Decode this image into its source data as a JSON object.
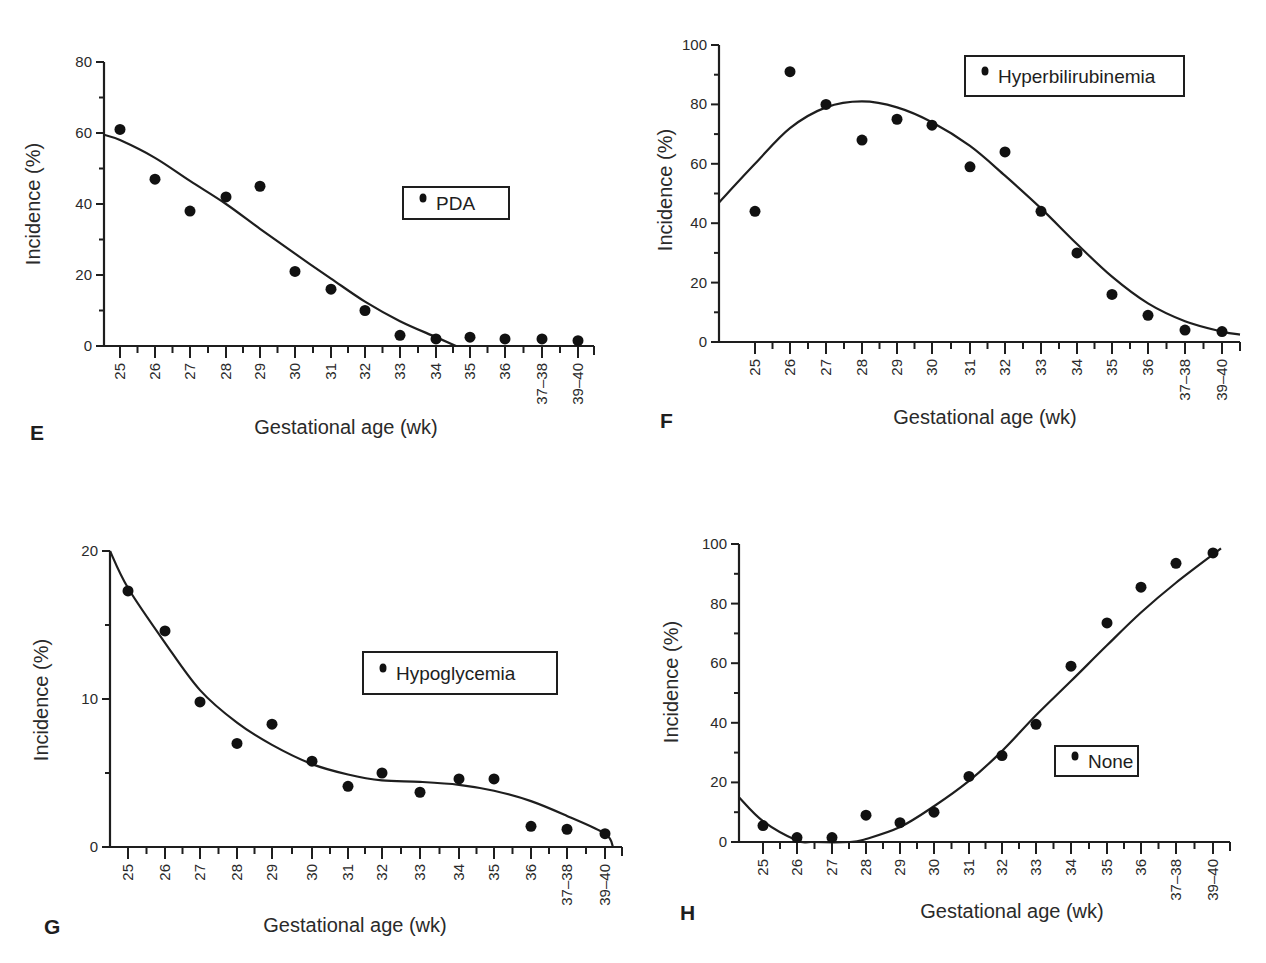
{
  "figure": {
    "panels": [
      "E",
      "F",
      "G",
      "H"
    ],
    "shared_xlabel": "Gestational age (wk)",
    "shared_ylabel": "Incidence (%)"
  },
  "chart_data": [
    {
      "panel": "E",
      "type": "scatter",
      "title": "",
      "legend": "PDA",
      "xlabel": "Gestational age (wk)",
      "ylabel": "Incidence (%)",
      "categories": [
        "25",
        "26",
        "27",
        "28",
        "29",
        "30",
        "31",
        "32",
        "33",
        "34",
        "35",
        "36",
        "37–38",
        "39–40"
      ],
      "values": [
        61,
        47,
        38,
        42,
        45,
        21,
        16,
        10,
        3,
        2,
        2.5,
        2,
        2,
        1.5
      ],
      "fit_curve": [
        59,
        53,
        46,
        40,
        33,
        26,
        19,
        13,
        7,
        2,
        0,
        0,
        0,
        0
      ],
      "yticks": [
        0,
        20,
        40,
        60,
        80
      ],
      "ylim": [
        0,
        80
      ],
      "grid": false
    },
    {
      "panel": "F",
      "type": "scatter",
      "title": "",
      "legend": "Hyperbilirubinemia",
      "xlabel": "Gestational age (wk)",
      "ylabel": "Incidence (%)",
      "categories": [
        "25",
        "26",
        "27",
        "28",
        "29",
        "30",
        "31",
        "32",
        "33",
        "34",
        "35",
        "36",
        "37–38",
        "39–40"
      ],
      "values": [
        44,
        91,
        80,
        68,
        75,
        73,
        59,
        64,
        44,
        30,
        16,
        9,
        4,
        3.5
      ],
      "fit_curve": [
        58,
        72,
        79,
        81,
        79,
        74,
        66,
        56,
        45,
        33,
        22,
        13,
        7,
        3
      ],
      "yticks": [
        0,
        20,
        40,
        60,
        80,
        100
      ],
      "ylim": [
        0,
        100
      ],
      "grid": false
    },
    {
      "panel": "G",
      "type": "scatter",
      "title": "",
      "legend": "Hypoglycemia",
      "xlabel": "Gestational age (wk)",
      "ylabel": "Incidence (%)",
      "categories": [
        "25",
        "26",
        "27",
        "28",
        "29",
        "30",
        "31",
        "32",
        "33",
        "34",
        "35",
        "36",
        "37–38",
        "39–40"
      ],
      "values": [
        17.3,
        14.6,
        9.8,
        7.0,
        8.3,
        5.8,
        4.1,
        5.0,
        3.7,
        4.6,
        4.6,
        1.4,
        1.2,
        0.9
      ],
      "fit_curve": [
        17.5,
        13.8,
        10.6,
        8.4,
        6.9,
        5.6,
        4.9,
        4.5,
        4.4,
        4.2,
        3.8,
        3.1,
        2.1,
        0.7
      ],
      "yticks": [
        0,
        10,
        20
      ],
      "ylim": [
        0,
        20
      ],
      "grid": false
    },
    {
      "panel": "H",
      "type": "scatter",
      "title": "",
      "legend": "None",
      "xlabel": "Gestational age (wk)",
      "ylabel": "Incidence (%)",
      "categories": [
        "25",
        "26",
        "27",
        "28",
        "29",
        "30",
        "31",
        "32",
        "33",
        "34",
        "35",
        "36",
        "37–38",
        "39–40"
      ],
      "values": [
        5.5,
        1.5,
        1.5,
        9,
        6.5,
        10,
        22,
        29,
        39.5,
        59,
        73.5,
        85.5,
        93.5,
        97
      ],
      "fit_curve": [
        7,
        1,
        0,
        1,
        5,
        12,
        20,
        30,
        43,
        54,
        66,
        77,
        87,
        96
      ],
      "yticks": [
        0,
        20,
        40,
        60,
        80,
        100
      ],
      "ylim": [
        0,
        100
      ],
      "grid": false
    }
  ]
}
